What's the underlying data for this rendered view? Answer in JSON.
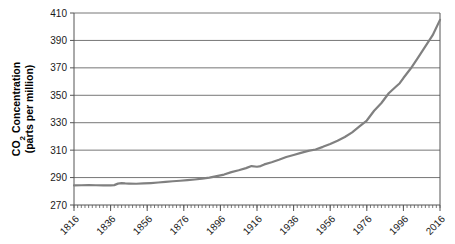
{
  "chart_data": {
    "type": "line",
    "title": "",
    "xlabel": "",
    "ylabel_line1": "CO2 Concentration",
    "ylabel_line2": "(parts per million)",
    "ylabel_sub": "2",
    "ylabel_prefix": "CO",
    "ylim": [
      270,
      410
    ],
    "xlim": [
      1816,
      2016
    ],
    "yticks": [
      270,
      290,
      310,
      330,
      350,
      370,
      390,
      410
    ],
    "xticks": [
      1816,
      1836,
      1856,
      1876,
      1896,
      1916,
      1936,
      1956,
      1976,
      1996,
      2016
    ],
    "grid": true,
    "grid_axis": "y",
    "legend": "none",
    "line_color": "#808080",
    "line_width": 2.2,
    "axis_color": "#555555",
    "minor_tick_interval": 2,
    "series": [
      {
        "name": "CO2 concentration",
        "x": [
          1816,
          1820,
          1824,
          1828,
          1832,
          1836,
          1838,
          1840,
          1842,
          1844,
          1846,
          1850,
          1854,
          1858,
          1862,
          1866,
          1870,
          1874,
          1878,
          1882,
          1886,
          1890,
          1894,
          1898,
          1902,
          1906,
          1910,
          1913,
          1916,
          1918,
          1920,
          1924,
          1928,
          1932,
          1936,
          1940,
          1944,
          1948,
          1952,
          1956,
          1960,
          1964,
          1968,
          1972,
          1976,
          1980,
          1984,
          1988,
          1992,
          1994,
          1996,
          2000,
          2004,
          2008,
          2012,
          2016
        ],
        "y": [
          284.3,
          284.4,
          284.5,
          284.4,
          284.3,
          284.3,
          284.5,
          285.6,
          285.9,
          285.7,
          285.6,
          285.5,
          285.7,
          286.0,
          286.4,
          286.9,
          287.3,
          287.7,
          288.1,
          288.6,
          289.2,
          290.0,
          291.1,
          292.2,
          294.0,
          295.3,
          296.9,
          298.4,
          297.9,
          298.4,
          299.6,
          301.2,
          303.0,
          305.0,
          306.5,
          308.0,
          309.5,
          310.5,
          312.4,
          314.5,
          316.9,
          319.6,
          323.0,
          327.3,
          331.6,
          338.7,
          344.4,
          351.5,
          356.4,
          358.8,
          362.6,
          369.5,
          377.5,
          385.6,
          393.8,
          405.0
        ]
      }
    ]
  },
  "annotations": {}
}
